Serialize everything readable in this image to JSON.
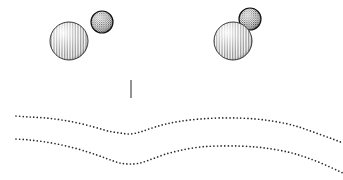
{
  "figure": {
    "canvas": {
      "width": 343,
      "height": 180,
      "background": "#ffffff"
    },
    "title": "",
    "caption": "",
    "ink_color": "#1a1a1a",
    "stipple_color": "#303030"
  },
  "particles": {
    "group_label": "sphere-pairs",
    "items": [
      {
        "name": "left-large-sphere",
        "role": "large",
        "cx": 69,
        "cy": 41,
        "r": 19,
        "shading": "vertical-hatch",
        "fill_tone": "#9a9a9a",
        "outline": "#222222",
        "depth": "front"
      },
      {
        "name": "left-small-sphere",
        "role": "small",
        "cx": 102,
        "cy": 22,
        "r": 11,
        "shading": "coarse-stipple",
        "fill_tone": "#565656",
        "outline": "#111111",
        "depth": "front"
      },
      {
        "name": "right-small-sphere",
        "role": "small",
        "cx": 250,
        "cy": 19,
        "r": 11,
        "shading": "coarse-stipple",
        "fill_tone": "#565656",
        "outline": "#111111",
        "depth": "back"
      },
      {
        "name": "right-large-sphere",
        "role": "large",
        "cx": 233,
        "cy": 41,
        "r": 19,
        "shading": "vertical-hatch",
        "fill_tone": "#9a9a9a",
        "outline": "#222222",
        "depth": "front"
      }
    ]
  },
  "marker": {
    "name": "vertical-tick",
    "x": 131,
    "y_top": 80,
    "y_bottom": 98,
    "color": "#262626",
    "width": 1,
    "label": ""
  },
  "curves": {
    "style": "dotted",
    "dot_radius": 0.85,
    "dot_spacing": 3.4,
    "color": "#2b2b2b",
    "items": [
      {
        "name": "upper-interface-curve",
        "points": [
          [
            16,
            116
          ],
          [
            30,
            117
          ],
          [
            46,
            118
          ],
          [
            62,
            120
          ],
          [
            78,
            123
          ],
          [
            94,
            127
          ],
          [
            108,
            131
          ],
          [
            120,
            133
          ],
          [
            130,
            134
          ],
          [
            140,
            132
          ],
          [
            152,
            128
          ],
          [
            166,
            124
          ],
          [
            182,
            121
          ],
          [
            200,
            119
          ],
          [
            218,
            118
          ],
          [
            238,
            118
          ],
          [
            256,
            119
          ],
          [
            272,
            121
          ],
          [
            288,
            124
          ],
          [
            302,
            128
          ],
          [
            316,
            133
          ],
          [
            330,
            138
          ],
          [
            343,
            143
          ]
        ]
      },
      {
        "name": "lower-interface-curve",
        "points": [
          [
            16,
            139
          ],
          [
            30,
            140
          ],
          [
            46,
            142
          ],
          [
            62,
            145
          ],
          [
            78,
            149
          ],
          [
            94,
            154
          ],
          [
            108,
            159
          ],
          [
            120,
            163
          ],
          [
            130,
            164
          ],
          [
            140,
            163
          ],
          [
            152,
            159
          ],
          [
            166,
            154
          ],
          [
            182,
            150
          ],
          [
            200,
            147
          ],
          [
            218,
            146
          ],
          [
            238,
            146
          ],
          [
            256,
            147
          ],
          [
            272,
            149
          ],
          [
            288,
            152
          ],
          [
            302,
            156
          ],
          [
            316,
            161
          ],
          [
            330,
            167
          ],
          [
            343,
            173
          ]
        ]
      }
    ]
  }
}
